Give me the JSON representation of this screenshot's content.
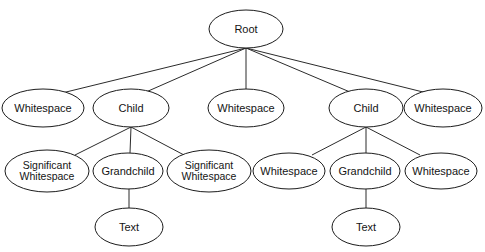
{
  "diagram": {
    "type": "tree-diagram",
    "background_color": "#ffffff",
    "stroke_color": "#1c1c1c",
    "edge_color": "#2b2b2b",
    "text_color": "#141414",
    "nodes": [
      {
        "id": "root",
        "label": "Root",
        "lines": [
          "Root"
        ],
        "cx": 246,
        "cy": 29,
        "rx": 37,
        "ry": 19,
        "depth": 0
      },
      {
        "id": "ws-l1",
        "label": "Whitespace",
        "lines": [
          "Whitespace"
        ],
        "cx": 43,
        "cy": 108,
        "rx": 41,
        "ry": 19,
        "depth": 1
      },
      {
        "id": "child-left",
        "label": "Child",
        "lines": [
          "Child"
        ],
        "cx": 131,
        "cy": 108,
        "rx": 38,
        "ry": 19,
        "depth": 1
      },
      {
        "id": "ws-l2",
        "label": "Whitespace",
        "lines": [
          "Whitespace"
        ],
        "cx": 246,
        "cy": 108,
        "rx": 38,
        "ry": 19,
        "depth": 1
      },
      {
        "id": "child-right",
        "label": "Child",
        "lines": [
          "Child"
        ],
        "cx": 366,
        "cy": 108,
        "rx": 37,
        "ry": 19,
        "depth": 1
      },
      {
        "id": "ws-l3",
        "label": "Whitespace",
        "lines": [
          "Whitespace"
        ],
        "cx": 443,
        "cy": 108,
        "rx": 39,
        "ry": 19,
        "depth": 1
      },
      {
        "id": "sigws-1",
        "label": "Significant Whitespace",
        "lines": [
          "Significant",
          "Whitespace"
        ],
        "cx": 47,
        "cy": 171,
        "rx": 42,
        "ry": 21,
        "depth": 2
      },
      {
        "id": "grandchild-left",
        "label": "Grandchild",
        "lines": [
          "Grandchild"
        ],
        "cx": 128,
        "cy": 171,
        "rx": 35,
        "ry": 18,
        "depth": 2
      },
      {
        "id": "sigws-2",
        "label": "Significant Whitespace",
        "lines": [
          "Significant",
          "Whitespace"
        ],
        "cx": 209,
        "cy": 171,
        "rx": 42,
        "ry": 21,
        "depth": 2
      },
      {
        "id": "ws-l4",
        "label": "Whitespace",
        "lines": [
          "Whitespace"
        ],
        "cx": 289,
        "cy": 171,
        "rx": 36,
        "ry": 18,
        "depth": 2
      },
      {
        "id": "grandchild-right",
        "label": "Grandchild",
        "lines": [
          "Grandchild"
        ],
        "cx": 365,
        "cy": 171,
        "rx": 35,
        "ry": 18,
        "depth": 2
      },
      {
        "id": "ws-l5",
        "label": "Whitespace",
        "lines": [
          "Whitespace"
        ],
        "cx": 441,
        "cy": 171,
        "rx": 36,
        "ry": 18,
        "depth": 2
      },
      {
        "id": "text-left",
        "label": "Text",
        "lines": [
          "Text"
        ],
        "cx": 129,
        "cy": 227,
        "rx": 34,
        "ry": 19,
        "depth": 3
      },
      {
        "id": "text-right",
        "label": "Text",
        "lines": [
          "Text"
        ],
        "cx": 366,
        "cy": 227,
        "rx": 34,
        "ry": 19,
        "depth": 3
      }
    ],
    "edges": [
      {
        "from": "root",
        "to": "ws-l1",
        "x1": 246,
        "y1": 48,
        "x2": 62,
        "y2": 93
      },
      {
        "from": "root",
        "to": "child-left",
        "x1": 246,
        "y1": 48,
        "x2": 146,
        "y2": 92
      },
      {
        "from": "root",
        "to": "ws-l2",
        "x1": 246,
        "y1": 48,
        "x2": 246,
        "y2": 89
      },
      {
        "from": "root",
        "to": "child-right",
        "x1": 246,
        "y1": 48,
        "x2": 350,
        "y2": 92
      },
      {
        "from": "root",
        "to": "ws-l3",
        "x1": 246,
        "y1": 48,
        "x2": 427,
        "y2": 93
      },
      {
        "from": "child-left",
        "to": "sigws-1",
        "x1": 131,
        "y1": 127,
        "x2": 75,
        "y2": 155
      },
      {
        "from": "child-left",
        "to": "grandchild-left",
        "x1": 131,
        "y1": 127,
        "x2": 130,
        "y2": 153
      },
      {
        "from": "child-left",
        "to": "sigws-2",
        "x1": 131,
        "y1": 127,
        "x2": 184,
        "y2": 155
      },
      {
        "from": "child-right",
        "to": "ws-l4",
        "x1": 366,
        "y1": 127,
        "x2": 312,
        "y2": 155
      },
      {
        "from": "child-right",
        "to": "grandchild-right",
        "x1": 366,
        "y1": 127,
        "x2": 366,
        "y2": 153
      },
      {
        "from": "child-right",
        "to": "ws-l5",
        "x1": 366,
        "y1": 127,
        "x2": 420,
        "y2": 155
      },
      {
        "from": "grandchild-left",
        "to": "text-left",
        "x1": 129,
        "y1": 189,
        "x2": 129,
        "y2": 208
      },
      {
        "from": "grandchild-right",
        "to": "text-right",
        "x1": 366,
        "y1": 189,
        "x2": 366,
        "y2": 208
      }
    ]
  }
}
